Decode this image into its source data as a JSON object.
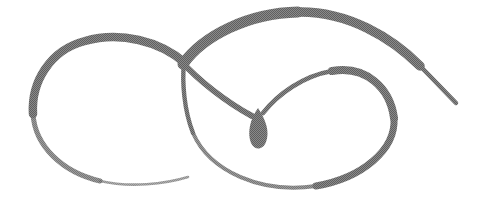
{
  "artwork": {
    "title": "Calligraphic Double-Loop Flourish",
    "subject": "abstract pen flourish",
    "medium": "halftone-dithered grayscale line drawing",
    "canvas": {
      "width": 488,
      "height": 210,
      "background_color": "#ffffff"
    },
    "ink": {
      "stroke_color": "#7c7c7c",
      "stroke_color_dark": "#6a6a6a",
      "stroke_color_light": "#9a9a9a",
      "texture": "halftone-dither"
    },
    "strokes": [
      {
        "name": "left-loop",
        "description": "large open oval loop on the left that tapers to a thin tail at lower right",
        "path": "M 185 63 C 160 41, 120 31, 85 41 C 46 52, 28 88, 33 120 C 38 155, 75 180, 120 184 C 148 186, 172 182, 188 178",
        "width_start": 9,
        "width_end": 2
      },
      {
        "name": "top-arc",
        "description": "broad thick arc sweeping up from the crossing point over the top and tapering off to the right edge",
        "path": "M 183 64 C 205 32, 252 12, 300 12 C 350 12, 400 40, 430 75 C 443 90, 452 99, 458 104",
        "width_start": 7,
        "width_end": 1
      },
      {
        "name": "crossing-descender",
        "description": "stroke descending from the crossing point down and right into the teardrop",
        "path": "M 182 62 C 200 82, 230 104, 255 116",
        "width_start": 6,
        "width_end": 8
      },
      {
        "name": "teardrop-terminal",
        "description": "filled pointed teardrop blob where the descending stroke terminates",
        "center_x": 259,
        "center_y": 126,
        "width": 14,
        "height": 28
      },
      {
        "name": "inner-spiral",
        "description": "stroke rising from the teardrop, arcing right and sweeping into the right loop",
        "path": "M 262 114 C 280 92, 310 72, 342 70 C 372 68, 392 90, 394 118",
        "width_start": 3,
        "width_end": 8
      },
      {
        "name": "right-loop",
        "description": "large oval loop on the right, closing back up to the crossing point",
        "path": "M 394 118 C 396 150, 360 180, 310 187 C 255 194, 205 170, 190 130 C 182 106, 182 80, 184 63",
        "width_start": 8,
        "width_end": 3
      }
    ],
    "key_points": [
      {
        "name": "crossing-point",
        "x": 185,
        "y": 62
      },
      {
        "name": "teardrop-center",
        "x": 259,
        "y": 126
      },
      {
        "name": "top-arc-apex",
        "x": 300,
        "y": 12
      },
      {
        "name": "right-tail-end",
        "x": 458,
        "y": 104
      },
      {
        "name": "left-tail-end",
        "x": 188,
        "y": 178
      },
      {
        "name": "left-loop-extreme-left",
        "x": 32,
        "y": 118
      },
      {
        "name": "right-loop-extreme-right",
        "x": 395,
        "y": 120
      },
      {
        "name": "right-loop-bottom",
        "x": 300,
        "y": 188
      }
    ]
  }
}
